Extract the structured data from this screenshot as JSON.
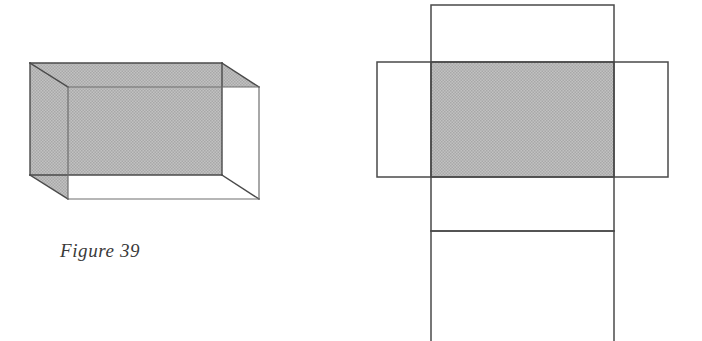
{
  "figure": {
    "caption": "Figure 39",
    "caption_style": "italic-serif"
  },
  "colors": {
    "stroke": "#4a4a4a",
    "stroke_light": "#6e6e6e",
    "shade_fill": "#b9b9b9",
    "background": "#ffffff"
  },
  "left_figure": {
    "name": "rectangular-prism-3d",
    "description": "Wireframe rectangular prism (cuboid) shown in oblique projection with the back face, top face and left face shaded gray.",
    "stroke_width": 1.4,
    "vertices": {
      "back_top_left": [
        30,
        63
      ],
      "back_top_right": [
        222,
        63
      ],
      "back_bottom_left": [
        30,
        175
      ],
      "back_bottom_right": [
        222,
        175
      ],
      "front_top_left": [
        68,
        87
      ],
      "front_top_right": [
        259,
        87
      ],
      "front_bottom_left": [
        68,
        199
      ],
      "front_bottom_right": [
        259,
        199
      ]
    },
    "shaded_polygons": [
      {
        "name": "back-face",
        "points": "30,63 222,63 222,175 30,175"
      },
      {
        "name": "top-face",
        "points": "30,63 222,63 259,87 68,87"
      },
      {
        "name": "left-face",
        "points": "30,63 68,87 68,199 30,175"
      }
    ],
    "edges": [
      {
        "name": "back-top-edge",
        "from": [
          30,
          63
        ],
        "to": [
          222,
          63
        ]
      },
      {
        "name": "back-right-edge",
        "from": [
          222,
          63
        ],
        "to": [
          222,
          175
        ]
      },
      {
        "name": "back-bottom-edge",
        "from": [
          30,
          175
        ],
        "to": [
          222,
          175
        ]
      },
      {
        "name": "back-left-edge",
        "from": [
          30,
          63
        ],
        "to": [
          30,
          175
        ]
      },
      {
        "name": "front-top-edge",
        "from": [
          68,
          87
        ],
        "to": [
          259,
          87
        ]
      },
      {
        "name": "front-right-edge",
        "from": [
          259,
          87
        ],
        "to": [
          259,
          199
        ]
      },
      {
        "name": "front-bottom-edge",
        "from": [
          68,
          199
        ],
        "to": [
          259,
          199
        ]
      },
      {
        "name": "front-left-edge",
        "from": [
          68,
          87
        ],
        "to": [
          68,
          199
        ]
      },
      {
        "name": "depth-edge-top-left",
        "from": [
          30,
          63
        ],
        "to": [
          68,
          87
        ]
      },
      {
        "name": "depth-edge-top-right",
        "from": [
          222,
          63
        ],
        "to": [
          259,
          87
        ]
      },
      {
        "name": "depth-edge-bottom-left",
        "from": [
          30,
          175
        ],
        "to": [
          68,
          199
        ]
      },
      {
        "name": "depth-edge-bottom-right",
        "from": [
          222,
          175
        ],
        "to": [
          259,
          199
        ]
      }
    ]
  },
  "right_figure": {
    "name": "prism-net-unfolded",
    "description": "Unfolded net of the rectangular prism: a central shaded face with four attached faces forming a cross, the bottom strip extending past the image edge.",
    "stroke_width": 1.6,
    "faces": [
      {
        "name": "net-top-face",
        "shaded": false,
        "x": 431,
        "y": 5,
        "width": 183,
        "height": 57
      },
      {
        "name": "net-left-face",
        "shaded": false,
        "x": 377,
        "y": 62,
        "width": 54,
        "height": 115
      },
      {
        "name": "net-center-face",
        "shaded": true,
        "x": 431,
        "y": 62,
        "width": 183,
        "height": 115
      },
      {
        "name": "net-right-face",
        "shaded": false,
        "x": 614,
        "y": 62,
        "width": 54,
        "height": 115
      },
      {
        "name": "net-bottom-face",
        "shaded": false,
        "x": 431,
        "y": 177,
        "width": 183,
        "height": 54
      },
      {
        "name": "net-bottom-extension-face",
        "shaded": false,
        "x": 431,
        "y": 231,
        "width": 183,
        "height": 110,
        "clipped_at_bottom": true
      }
    ]
  }
}
